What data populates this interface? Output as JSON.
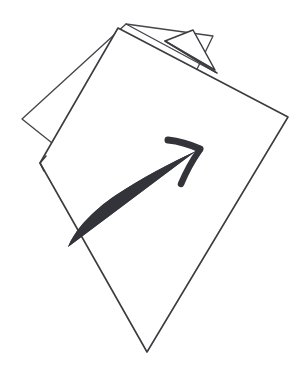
{
  "canvas": {
    "width": 305,
    "height": 374,
    "background_color": "#ffffff"
  },
  "illustration": {
    "title": "Hand-drawn swipe-pages sketch",
    "description": "Two overlapping tilted sheets of paper drawn as thin outlines, with a thick curved arrow sweeping from lower-left to upper-right across the front sheet.",
    "style": "hand-drawn line art",
    "ink_color": "#3b3b40",
    "back_ink_color": "#45454a",
    "arrow_color": "#33333a",
    "paper_fill": "#ffffff"
  },
  "shapes": {
    "back_sheet": {
      "name": "back-sheet",
      "label": "Back sheet of paper",
      "stroke_color": "#45454a",
      "stroke_width": 1.35,
      "points": "126,24 213,36 131,206 22,119"
    },
    "front_sheet": {
      "name": "front-sheet",
      "label": "Front sheet of paper",
      "stroke_color": "#3b3b40",
      "stroke_width": 1.6,
      "points": "118,28 288,117 147,352 40,163"
    },
    "front_sheet_fold_notch": {
      "name": "front-sheet-fold-notch",
      "label": "Fold notch on front sheet left edge",
      "points": "40,163 46,156 40,163 44,171"
    },
    "top_flap": {
      "name": "top-flap",
      "label": "Small raised paper flap at top",
      "stroke_color": "#3b3b40",
      "stroke_width": 1.5,
      "points": "165,41 193,30 215,70"
    },
    "flap_ridge": {
      "name": "flap-ridge",
      "label": "Ridge line of raised flap",
      "points": "165,41 217,73"
    },
    "back_edge_highlight": {
      "name": "back-edge-highlight",
      "label": "Back sheet top edge passing behind front sheet",
      "points": "126,24 215,72"
    },
    "back_left_edge": {
      "name": "back-left-edge",
      "label": "Back sheet left edge",
      "points": "22,119 40,163"
    }
  },
  "arrow": {
    "name": "curved-swipe-arrow",
    "label": "Curved swipe arrow",
    "direction": "lower-left to upper-right",
    "color": "#33333a",
    "tail_point": "68,247",
    "tip_point": "200,148",
    "body_path": "M 68,247 C 74,231 92,211 116,195 C 142,178 168,164 196,151",
    "head_upper_path": "M 200,149 C 189,144 178,141 168,140",
    "head_lower_path": "M 199,151 C 192,161 186,172 181,184"
  },
  "accessibility": {
    "alt_text": "Sketch of two overlapping sheets of paper with a curved arrow sweeping to the upper right, indicating a page swipe or turn."
  }
}
